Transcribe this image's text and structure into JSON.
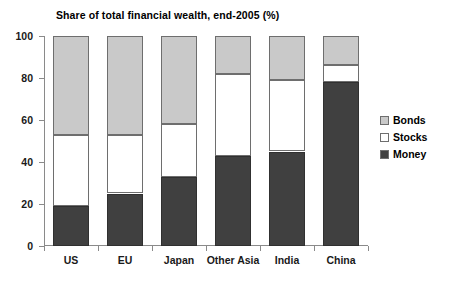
{
  "chart_data": {
    "type": "bar",
    "subtype": "stacked-bar-100",
    "title": "Share of total financial wealth, end-2005 (%)",
    "xlabel": "",
    "ylabel": "",
    "ylim": [
      0,
      100
    ],
    "yticks": [
      0,
      20,
      40,
      60,
      80,
      100
    ],
    "ytick_labels": [
      "0",
      "20",
      "40",
      "60",
      "80",
      "100"
    ],
    "grid": false,
    "legend_position": "right",
    "categories": [
      "US",
      "EU",
      "Japan",
      "Other Asia",
      "India",
      "China"
    ],
    "series": [
      {
        "name": "Money",
        "color": "#404040",
        "values": [
          19,
          25,
          33,
          43,
          45,
          78
        ]
      },
      {
        "name": "Stocks",
        "color": "#ffffff",
        "values": [
          34,
          28,
          25,
          39,
          34,
          8
        ]
      },
      {
        "name": "Bonds",
        "color": "#c9c9c9",
        "values": [
          47,
          47,
          42,
          18,
          21,
          14
        ]
      }
    ],
    "cumulative_tops": {
      "Money": [
        19,
        25,
        33,
        43,
        45,
        78
      ],
      "Stocks": [
        53,
        53,
        58,
        82,
        79,
        86
      ],
      "Bonds": [
        100,
        100,
        100,
        100,
        100,
        100
      ]
    },
    "legend": [
      {
        "label": "Bonds",
        "swatch": "#c9c9c9"
      },
      {
        "label": "Stocks",
        "swatch": "#ffffff"
      },
      {
        "label": "Money",
        "swatch": "#404040"
      }
    ]
  }
}
